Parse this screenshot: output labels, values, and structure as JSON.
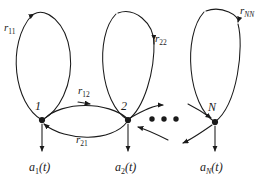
{
  "figure": {
    "background_color": "#ffffff",
    "stroke_color": "#1a1a1a"
  },
  "nodes": [
    {
      "id": "node-1",
      "label": "1",
      "x": 42,
      "y": 120
    },
    {
      "id": "node-2",
      "label": "2",
      "x": 128,
      "y": 120
    },
    {
      "id": "node-N",
      "label": "N",
      "x": 215,
      "y": 122
    }
  ],
  "self_loops": [
    {
      "id": "loop-r11",
      "label_base": "r",
      "label_sub": "11",
      "sub_italic": false,
      "label_x": 4,
      "label_y": 26
    },
    {
      "id": "loop-r22",
      "label_base": "r",
      "label_sub": "22",
      "sub_italic": false,
      "label_x": 154,
      "label_y": 36
    },
    {
      "id": "loop-rNN",
      "label_base": "r",
      "label_sub": "NN",
      "sub_italic": true,
      "label_x": 240,
      "label_y": 8
    }
  ],
  "cross_links": [
    {
      "id": "link-r12",
      "label_base": "r",
      "label_sub": "12",
      "sub_italic": false,
      "label_x": 78,
      "label_y": 88
    },
    {
      "id": "link-r21",
      "label_base": "r",
      "label_sub": "21",
      "sub_italic": false,
      "label_x": 76,
      "label_y": 135
    }
  ],
  "outputs": [
    {
      "id": "output-a1",
      "base": "a",
      "sub": "1",
      "sub_italic": false,
      "suffix": "(t)",
      "label_x": 30,
      "label_y": 163
    },
    {
      "id": "output-a2",
      "base": "a",
      "sub": "2",
      "sub_italic": false,
      "suffix": "(t)",
      "label_x": 116,
      "label_y": 163
    },
    {
      "id": "output-aN",
      "base": "a",
      "sub": "N",
      "sub_italic": true,
      "suffix": "(t)",
      "label_x": 201,
      "label_y": 163
    }
  ],
  "ellipsis": {
    "id": "node-ellipsis",
    "dots": 3,
    "x": 152,
    "y": 119,
    "spacing": 12
  }
}
